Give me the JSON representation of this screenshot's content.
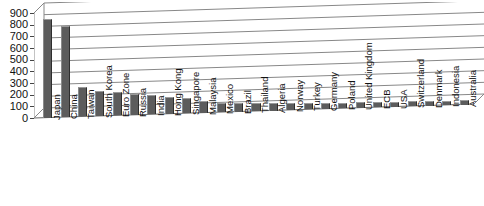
{
  "chart_data": {
    "type": "bar",
    "title": "",
    "subtitle": "",
    "xlabel": "",
    "ylabel": "",
    "ylim": [
      0,
      900
    ],
    "yticks": [
      0,
      100,
      200,
      300,
      400,
      500,
      600,
      700,
      800,
      900
    ],
    "ytick_labels": [
      "0",
      "100",
      "200",
      "300",
      "400",
      "500",
      "600",
      "700",
      "800",
      "900"
    ],
    "grid": true,
    "legend": "none",
    "orientation": "vertical",
    "bar_color": "#5c5c5c",
    "categories": [
      "Japan",
      "China",
      "Taiwan",
      "South Korea",
      "Euro Zone",
      "Russia",
      "India",
      "Hong Kong",
      "Singapore",
      "Malaysia",
      "Mexico",
      "Brazil",
      "Thailand",
      "Algeria",
      "Norway",
      "Turkey",
      "Germany",
      "Poland",
      "United Kingdom",
      "ECB",
      "USA",
      "Switzerland",
      "Denmark",
      "Indonesia",
      "Australia"
    ],
    "values": [
      845,
      780,
      250,
      210,
      200,
      180,
      170,
      140,
      130,
      100,
      80,
      75,
      70,
      65,
      60,
      55,
      52,
      50,
      48,
      46,
      45,
      42,
      40,
      38,
      36
    ]
  }
}
